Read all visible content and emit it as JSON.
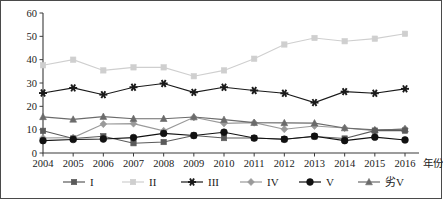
{
  "chart_data": {
    "type": "line",
    "title": "",
    "subtitle": "",
    "xlabel": "年份",
    "ylabel": "",
    "x": [
      2004,
      2005,
      2006,
      2007,
      2008,
      2009,
      2010,
      2011,
      2012,
      2013,
      2014,
      2015,
      2016
    ],
    "categories": [
      "2004",
      "2005",
      "2006",
      "2007",
      "2008",
      "2009",
      "2010",
      "2011",
      "2012",
      "2013",
      "2014",
      "2015",
      "2016"
    ],
    "xlim": [
      2004,
      2016
    ],
    "ylim": [
      0,
      60
    ],
    "yticks": [
      0,
      10,
      20,
      30,
      40,
      50,
      60
    ],
    "grid": false,
    "legend_position": "bottom",
    "series": [
      {
        "name": "I",
        "marker": "square",
        "color": "#5a5a5a",
        "values": [
          9.5,
          6.2,
          7.2,
          4.2,
          4.7,
          7.5,
          6.4,
          6.4,
          5.9,
          7.1,
          6.2,
          9.6,
          9.6
        ]
      },
      {
        "name": "II",
        "marker": "square",
        "color": "#cfcfcf",
        "values": [
          37.6,
          40.0,
          35.4,
          36.7,
          36.7,
          32.9,
          35.4,
          40.4,
          46.5,
          49.3,
          47.9,
          49.0,
          51.1
        ]
      },
      {
        "name": "III",
        "marker": "star",
        "color": "#1a1a1a",
        "values": [
          25.7,
          27.9,
          25.0,
          28.2,
          29.8,
          26.0,
          28.2,
          26.8,
          25.6,
          21.6,
          26.3,
          25.6,
          27.5
        ]
      },
      {
        "name": "IV",
        "marker": "diamond",
        "color": "#9a9a9a",
        "values": [
          6.4,
          6.6,
          12.4,
          12.6,
          9.5,
          15.3,
          12.7,
          13.0,
          10.2,
          11.6,
          10.7,
          9.6,
          10.4
        ]
      },
      {
        "name": "V",
        "marker": "circle",
        "color": "#111111",
        "values": [
          5.3,
          5.8,
          6.0,
          6.6,
          8.4,
          7.5,
          8.9,
          6.4,
          5.9,
          7.2,
          5.3,
          6.8,
          5.6
        ]
      },
      {
        "name": "劣V",
        "marker": "triangle",
        "color": "#6b6b6b",
        "values": [
          15.5,
          14.4,
          15.6,
          14.7,
          14.7,
          15.4,
          14.3,
          13.0,
          12.9,
          12.8,
          10.7,
          9.9,
          10.2
        ]
      }
    ]
  }
}
